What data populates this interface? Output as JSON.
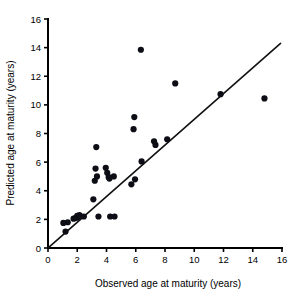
{
  "chart_data": {
    "type": "scatter",
    "title": "",
    "xlabel": "Observed age at maturity (years)",
    "ylabel": "Predicted age at maturity (years)",
    "xlim": [
      0,
      16
    ],
    "ylim": [
      0,
      16
    ],
    "xticks": [
      0,
      2,
      4,
      6,
      8,
      10,
      12,
      14,
      16
    ],
    "yticks": [
      0,
      2,
      4,
      6,
      8,
      10,
      12,
      14,
      16
    ],
    "xtick_labels": [
      "0",
      "2",
      "4",
      "6",
      "8",
      "10",
      "12",
      "14",
      "16"
    ],
    "ytick_labels": [
      "0",
      "2",
      "4",
      "6",
      "8",
      "10",
      "12",
      "14",
      "16"
    ],
    "grid": false,
    "legend": null,
    "point_color": "#0d0d16",
    "point_marker": "circle",
    "point_size": 3.1,
    "reference_line": {
      "name": "one-to-one-line",
      "description": "1:1 identity line y = x",
      "x": [
        0.05,
        15.9
      ],
      "y": [
        0.05,
        14.3
      ],
      "color": "#111111"
    },
    "points": [
      {
        "x": 1.05,
        "y": 1.75
      },
      {
        "x": 1.2,
        "y": 1.15
      },
      {
        "x": 1.35,
        "y": 1.8
      },
      {
        "x": 1.75,
        "y": 2.05
      },
      {
        "x": 1.9,
        "y": 2.1
      },
      {
        "x": 2.0,
        "y": 2.25
      },
      {
        "x": 2.05,
        "y": 2.15
      },
      {
        "x": 2.15,
        "y": 2.3
      },
      {
        "x": 2.45,
        "y": 2.2
      },
      {
        "x": 3.1,
        "y": 3.4
      },
      {
        "x": 3.2,
        "y": 4.7
      },
      {
        "x": 3.25,
        "y": 5.55
      },
      {
        "x": 3.3,
        "y": 7.05
      },
      {
        "x": 3.35,
        "y": 5.0
      },
      {
        "x": 3.45,
        "y": 2.2
      },
      {
        "x": 3.95,
        "y": 5.6
      },
      {
        "x": 4.05,
        "y": 5.25
      },
      {
        "x": 4.15,
        "y": 4.95
      },
      {
        "x": 4.2,
        "y": 4.85
      },
      {
        "x": 4.25,
        "y": 2.2
      },
      {
        "x": 4.5,
        "y": 5.0
      },
      {
        "x": 4.55,
        "y": 2.2
      },
      {
        "x": 5.7,
        "y": 4.45
      },
      {
        "x": 5.85,
        "y": 8.3
      },
      {
        "x": 5.9,
        "y": 9.15
      },
      {
        "x": 5.95,
        "y": 4.8
      },
      {
        "x": 6.35,
        "y": 13.85
      },
      {
        "x": 6.4,
        "y": 6.05
      },
      {
        "x": 7.25,
        "y": 7.45
      },
      {
        "x": 7.35,
        "y": 7.2
      },
      {
        "x": 8.15,
        "y": 7.6
      },
      {
        "x": 8.7,
        "y": 11.5
      },
      {
        "x": 11.8,
        "y": 10.75
      },
      {
        "x": 14.8,
        "y": 10.45
      }
    ]
  }
}
